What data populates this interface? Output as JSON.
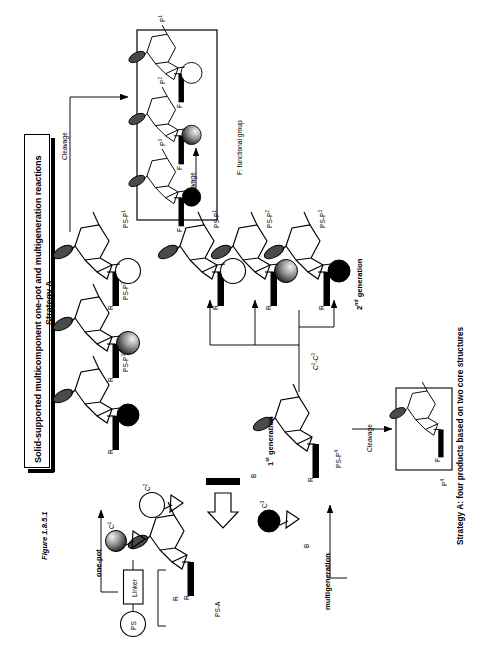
{
  "figure": {
    "caption_number": "Figure 1.8.5.1",
    "bottom_caption": "Strategy A: four products based on two core structures",
    "title_line1": "Solid-supported multicomponent one-pot and multigeneration reactions",
    "title_line2": "Strategy A",
    "legend_note": "F: functional group"
  },
  "labels": {
    "one_pot": "one-pot",
    "multigeneration": "multigeneration",
    "cleavage": "Cleavage",
    "generation_1": "1st generation",
    "generation_1_html": "1<sup>st</sup> generation",
    "generation_2": "2nd generation",
    "generation_2_html": "2<sup>nd</sup> generation",
    "building_blocks_range": "C1-C3",
    "building_blocks_range_html": "C<sup>1</sup>-C<sup>3</sup>",
    "ps": "PS",
    "linker": "Linker",
    "r_group": "R",
    "f_group": "F",
    "reagent_b": "B"
  },
  "building_blocks": [
    {
      "id": "c1",
      "label": "C1",
      "label_html": "C<sup>1</sup>",
      "fill": "gradient-gray"
    },
    {
      "id": "c2",
      "label": "C2",
      "label_html": "C<sup>2</sup>",
      "fill": "white"
    },
    {
      "id": "c3",
      "label": "C3",
      "label_html": "C<sup>3</sup>",
      "fill": "black"
    }
  ],
  "scaffolds": {
    "ps_a": "PS-A",
    "first_gen_product": "PS-P4",
    "first_gen_product_html": "PS-P<sup>4</sup>",
    "second_gen_products": [
      {
        "label": "PS-P1",
        "label_html": "PS-P<sup>1</sup>",
        "sphere": "white"
      },
      {
        "label": "PS-P2",
        "label_html": "PS-P<sup>2</sup>",
        "sphere": "gradient-gray"
      },
      {
        "label": "PS-P3",
        "label_html": "PS-P<sup>3</sup>",
        "sphere": "black"
      }
    ]
  },
  "products": {
    "cleaved_set": [
      {
        "label": "P1",
        "label_html": "P<sup>1</sup>",
        "sphere": "white"
      },
      {
        "label": "P2",
        "label_html": "P<sup>2</sup>",
        "sphere": "gradient-gray"
      },
      {
        "label": "P3",
        "label_html": "P<sup>3</sup>",
        "sphere": "black"
      }
    ],
    "single": {
      "label": "P4",
      "label_html": "P<sup>4</sup>"
    }
  },
  "colors": {
    "ink": "#000000",
    "paper": "#ffffff",
    "sphere_mid": "#9a9a9a"
  }
}
